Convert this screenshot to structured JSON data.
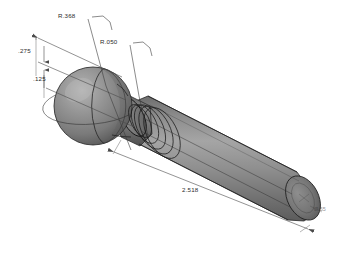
{
  "drawing": {
    "title": "Ball-End Pin Isometric CAD View",
    "background_color": "#ffffff",
    "view_type": "isometric-shaded-solid",
    "part_description": "Spherical ball head with grooved neck and cylindrical shaft",
    "body_fill_color": "#8a8a8a",
    "body_fill_dark": "#6b6b6b",
    "body_fill_light": "#a8a8a8",
    "edge_color": "#1f1f1f",
    "dimension_color": "#4a4a4a",
    "text_color": "#2b2b2b"
  },
  "dimensions": [
    {
      "id": "dim-275",
      "label": ".275",
      "kind": "linear",
      "description": "Upper offset dimension from left reference to ball top region"
    },
    {
      "id": "dim-125",
      "label": ".125",
      "kind": "linear",
      "description": "Lower offset dimension from left reference"
    },
    {
      "id": "radius-368",
      "label": "R.368",
      "kind": "radius",
      "description": "Radius of spherical ball head"
    },
    {
      "id": "radius-050",
      "label": "R.050",
      "kind": "radius",
      "description": "Fillet radius at neck groove"
    },
    {
      "id": "dim-2518",
      "label": "2.518",
      "kind": "linear",
      "description": "Overall length along cylindrical shaft"
    },
    {
      "id": "dim-endcap",
      "label": "Ø.55",
      "kind": "diameter",
      "description": "Faint label on right end cap face"
    }
  ],
  "labels": {
    "upper_offset": ".275",
    "lower_offset": ".125",
    "ball_radius": "R.368",
    "fillet_radius": "R.050",
    "overall_length": "2.518",
    "end_cap": "Ø.55"
  }
}
